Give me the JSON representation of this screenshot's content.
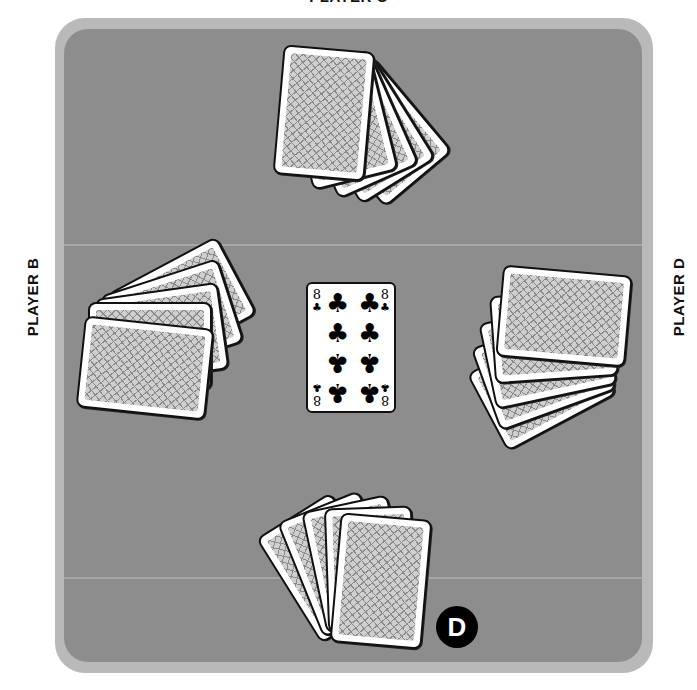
{
  "players": {
    "north": {
      "label": "PLAYER C",
      "cards_in_hand": 5
    },
    "west": {
      "label": "PLAYER B",
      "cards_in_hand": 5
    },
    "east": {
      "label": "PLAYER D",
      "cards_in_hand": 5
    },
    "south": {
      "label": "",
      "cards_in_hand": 5
    }
  },
  "center_card": {
    "rank": "8",
    "suit": "clubs",
    "suit_glyph": "♣"
  },
  "dealer_button": {
    "label": "D",
    "holder": "south"
  },
  "colors": {
    "felt": "#8d8d8d",
    "rim": "#b9b9b9",
    "card": "#ffffff",
    "dealer": "#000000"
  }
}
